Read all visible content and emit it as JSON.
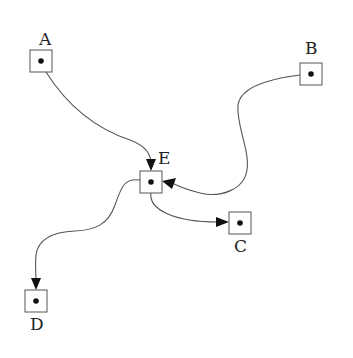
{
  "diagram": {
    "type": "directed-graph",
    "nodes": [
      {
        "id": "A",
        "label": "A"
      },
      {
        "id": "B",
        "label": "B"
      },
      {
        "id": "C",
        "label": "C"
      },
      {
        "id": "D",
        "label": "D"
      },
      {
        "id": "E",
        "label": "E"
      }
    ],
    "edges": [
      {
        "from": "A",
        "to": "E"
      },
      {
        "from": "B",
        "to": "E"
      },
      {
        "from": "E",
        "to": "C"
      },
      {
        "from": "E",
        "to": "D"
      }
    ]
  }
}
